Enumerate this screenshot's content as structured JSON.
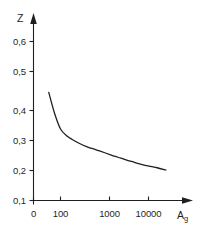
{
  "chart_data": {
    "type": "line",
    "title": "",
    "subtitle": "",
    "xlabel": "A_g",
    "ylabel": "Z",
    "xscale": "log",
    "yscale": "linear",
    "grid": false,
    "legend": false,
    "legend_position": "none",
    "xlim": [
      30,
      60000
    ],
    "ylim": [
      0.1,
      0.65
    ],
    "xticklabels": [
      "0",
      "100",
      "1000",
      "10000"
    ],
    "yticklabels": [
      "0,1",
      "0,2",
      "0,3",
      "0,4",
      "0,5",
      "0,6"
    ],
    "yticks": [
      0.1,
      0.2,
      0.3,
      0.4,
      0.5,
      0.6
    ],
    "series": [
      {
        "name": "Z",
        "x": [
          50,
          70,
          100,
          150,
          200,
          300,
          500,
          700,
          1000,
          2000,
          3000,
          5000,
          7000,
          10000,
          20000,
          30000,
          50000
        ],
        "y": [
          0.44,
          0.375,
          0.325,
          0.302,
          0.292,
          0.28,
          0.268,
          0.262,
          0.256,
          0.243,
          0.236,
          0.227,
          0.222,
          0.216,
          0.207,
          0.203,
          0.196
        ]
      }
    ],
    "annotations": []
  },
  "axes": {
    "y_axis": {
      "name": "Z",
      "arrow": "up-arrow",
      "labels": [
        {
          "text": "0,6"
        },
        {
          "text": "0,5"
        },
        {
          "text": "0,4"
        },
        {
          "text": "0,3"
        },
        {
          "text": "0,2"
        },
        {
          "text": "0,1"
        }
      ]
    },
    "x_axis": {
      "name": "A",
      "subscript": "g",
      "arrow": "right-arrow",
      "labels": [
        {
          "text": "0"
        },
        {
          "text": "100"
        },
        {
          "text": "1000"
        },
        {
          "text": "10000"
        }
      ]
    }
  },
  "colors": {
    "background": "#ffffff",
    "ink": "#1f1f1f",
    "curve": "#1f1f1f"
  }
}
